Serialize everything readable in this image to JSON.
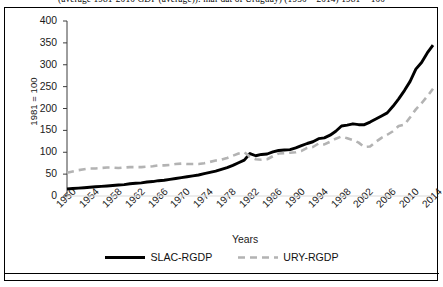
{
  "caption": "(average 1981-2010 GDP (average)): mar dat of Uruguay) (1950 – 2014) 1981 = 100",
  "chart_data": {
    "type": "line",
    "title": "",
    "xlabel": "Years",
    "ylabel": "1981 = 100",
    "xlim": [
      1950,
      2014
    ],
    "ylim": [
      0,
      400
    ],
    "ytick_labels": [
      "400",
      "350",
      "300",
      "250",
      "200",
      "150",
      "100",
      "50",
      "0"
    ],
    "ytick_values": [
      400,
      350,
      300,
      250,
      200,
      150,
      100,
      50,
      0
    ],
    "xtick_labels": [
      "1950",
      "1954",
      "1958",
      "1962",
      "1966",
      "1970",
      "1974",
      "1978",
      "1982",
      "1986",
      "1990",
      "1994",
      "1998",
      "2002",
      "2006",
      "2010",
      "2014"
    ],
    "xtick_values": [
      1950,
      1954,
      1958,
      1962,
      1966,
      1970,
      1974,
      1978,
      1982,
      1986,
      1990,
      1994,
      1998,
      2002,
      2006,
      2010,
      2014
    ],
    "grid": false,
    "legend_position": "bottom",
    "x": [
      1950,
      1951,
      1952,
      1953,
      1954,
      1955,
      1956,
      1957,
      1958,
      1959,
      1960,
      1961,
      1962,
      1963,
      1964,
      1965,
      1966,
      1967,
      1968,
      1969,
      1970,
      1971,
      1972,
      1973,
      1974,
      1975,
      1976,
      1977,
      1978,
      1979,
      1980,
      1981,
      1982,
      1983,
      1984,
      1985,
      1986,
      1987,
      1988,
      1989,
      1990,
      1991,
      1992,
      1993,
      1994,
      1995,
      1996,
      1997,
      1998,
      1999,
      2000,
      2001,
      2002,
      2003,
      2004,
      2005,
      2006,
      2007,
      2008,
      2009,
      2010,
      2011,
      2012,
      2013,
      2014
    ],
    "series": [
      {
        "name": "SLAC-RGDP",
        "style": "solid",
        "color": "#000000",
        "values": [
          16,
          17,
          18,
          19,
          20,
          21,
          22,
          23,
          24,
          25,
          26,
          28,
          29,
          30,
          32,
          33,
          35,
          36,
          38,
          40,
          42,
          44,
          46,
          48,
          51,
          54,
          57,
          61,
          65,
          70,
          76,
          82,
          97,
          92,
          95,
          96,
          101,
          104,
          105,
          106,
          110,
          115,
          120,
          124,
          131,
          133,
          139,
          148,
          160,
          162,
          165,
          163,
          163,
          169,
          176,
          183,
          190,
          205,
          222,
          241,
          262,
          290,
          305,
          327,
          345
        ]
      },
      {
        "name": "URY-RGDP",
        "style": "dashed",
        "color": "#b3b3b3",
        "values": [
          53,
          56,
          59,
          61,
          63,
          63,
          64,
          65,
          65,
          64,
          65,
          66,
          66,
          66,
          67,
          68,
          70,
          70,
          71,
          73,
          74,
          73,
          73,
          73,
          75,
          78,
          81,
          83,
          87,
          92,
          97,
          100,
          90,
          84,
          83,
          84,
          91,
          97,
          98,
          99,
          100,
          103,
          110,
          112,
          120,
          118,
          124,
          131,
          136,
          132,
          128,
          122,
          112,
          113,
          124,
          133,
          140,
          148,
          160,
          163,
          180,
          198,
          212,
          228,
          245
        ]
      }
    ]
  },
  "legend": {
    "entries": [
      {
        "label": "SLAC-RGDP",
        "swatch": "solid-black-line"
      },
      {
        "label": "URY-RGDP",
        "swatch": "dashed-gray-line"
      }
    ]
  }
}
